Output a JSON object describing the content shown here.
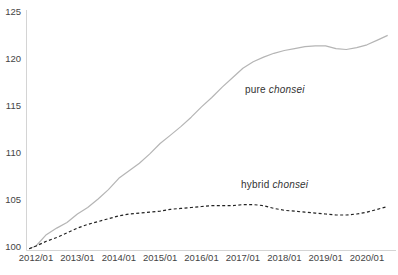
{
  "chart_data": {
    "type": "line",
    "title": "",
    "xlabel": "",
    "ylabel": "",
    "ylim": [
      100,
      125
    ],
    "grid": false,
    "legend_position": "inline-annotations",
    "y_ticks": [
      100,
      105,
      110,
      115,
      120,
      125
    ],
    "x_tick_labels": [
      "2012/01",
      "2013/01",
      "2014/01",
      "2015/01",
      "2016/01",
      "2017/01",
      "2018/01",
      "2019/01",
      "2020/01"
    ],
    "dates": [
      "2011/11",
      "2012/01",
      "2012/04",
      "2012/07",
      "2012/10",
      "2013/01",
      "2013/04",
      "2013/07",
      "2013/10",
      "2014/01",
      "2014/04",
      "2014/07",
      "2014/10",
      "2015/01",
      "2015/04",
      "2015/07",
      "2015/10",
      "2016/01",
      "2016/04",
      "2016/07",
      "2016/10",
      "2017/01",
      "2017/04",
      "2017/07",
      "2017/10",
      "2018/01",
      "2018/04",
      "2018/07",
      "2018/10",
      "2019/01",
      "2019/04",
      "2019/07",
      "2019/10",
      "2020/01",
      "2020/04",
      "2020/07"
    ],
    "series": [
      {
        "name": "pure chonsei",
        "style": "solid",
        "color": "#b5b5b5",
        "values": [
          99.7,
          100.0,
          101.2,
          101.9,
          102.5,
          103.4,
          104.1,
          105.0,
          106.0,
          107.2,
          108.0,
          108.8,
          109.8,
          110.9,
          111.8,
          112.7,
          113.7,
          114.8,
          115.8,
          116.9,
          117.9,
          118.9,
          119.6,
          120.1,
          120.5,
          120.8,
          121.0,
          121.2,
          121.3,
          121.3,
          121.0,
          120.9,
          121.1,
          121.4,
          121.9,
          122.4
        ]
      },
      {
        "name": "hybrid chonsei",
        "style": "dashed",
        "color": "#222222",
        "values": [
          99.7,
          100.0,
          100.5,
          100.9,
          101.4,
          101.9,
          102.3,
          102.6,
          102.9,
          103.2,
          103.4,
          103.5,
          103.6,
          103.7,
          103.9,
          104.0,
          104.1,
          104.2,
          104.3,
          104.3,
          104.3,
          104.4,
          104.4,
          104.3,
          104.0,
          103.8,
          103.7,
          103.6,
          103.5,
          103.4,
          103.3,
          103.3,
          103.4,
          103.6,
          103.9,
          104.2
        ]
      }
    ],
    "annotations": [
      {
        "prefix": "pure ",
        "italic": "chonsei"
      },
      {
        "prefix": "hybrid ",
        "italic": "chonsei"
      }
    ],
    "colors": {
      "axis": "#d4d4d4",
      "tick_text": "#444444",
      "annotation_text": "#333333",
      "background": "#ffffff"
    }
  }
}
